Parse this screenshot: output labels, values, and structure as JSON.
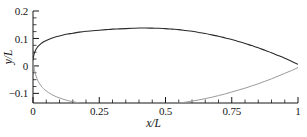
{
  "chart_data": {
    "type": "line",
    "title": "",
    "xlabel": "x/L",
    "ylabel": "y/L",
    "xlim": [
      0,
      1
    ],
    "ylim": [
      -0.135,
      0.2
    ],
    "grid": false,
    "legend_position": "none",
    "xticks": [
      0,
      0.25,
      0.5,
      0.75,
      1
    ],
    "xtick_labels": [
      "0",
      "0.25",
      "0.5",
      "0.75",
      "1"
    ],
    "x_minor_tick_step": 0.05,
    "yticks": [
      -0.1,
      0,
      0.1,
      0.2
    ],
    "ytick_labels": [
      "−0.1",
      "0",
      "0.1",
      "0.2"
    ],
    "y_minor_tick_step": 0.025,
    "annotations": [],
    "series": [
      {
        "name": "upper-surface",
        "color": "#2a2a2a",
        "x": [
          0.0,
          0.002,
          0.005,
          0.01,
          0.015,
          0.02,
          0.03,
          0.04,
          0.05,
          0.07,
          0.09,
          0.11,
          0.13,
          0.15,
          0.175,
          0.2,
          0.225,
          0.25,
          0.275,
          0.3,
          0.325,
          0.35,
          0.375,
          0.4,
          0.425,
          0.45,
          0.475,
          0.5,
          0.525,
          0.55,
          0.575,
          0.6,
          0.625,
          0.65,
          0.675,
          0.7,
          0.725,
          0.75,
          0.775,
          0.8,
          0.825,
          0.85,
          0.875,
          0.9,
          0.925,
          0.95,
          0.975,
          1.0
        ],
        "y": [
          0.022,
          0.034,
          0.046,
          0.058,
          0.066,
          0.072,
          0.081,
          0.088,
          0.093,
          0.101,
          0.107,
          0.112,
          0.116,
          0.119,
          0.123,
          0.126,
          0.128,
          0.13,
          0.132,
          0.134,
          0.135,
          0.136,
          0.137,
          0.138,
          0.138,
          0.1375,
          0.137,
          0.136,
          0.134,
          0.132,
          0.129,
          0.126,
          0.122,
          0.118,
          0.113,
          0.108,
          0.102,
          0.096,
          0.089,
          0.082,
          0.074,
          0.066,
          0.057,
          0.048,
          0.038,
          0.028,
          0.017,
          0.006
        ]
      },
      {
        "name": "lower-surface",
        "color": "#9a9a9a",
        "x": [
          0.0,
          0.002,
          0.005,
          0.01,
          0.015,
          0.02,
          0.03,
          0.04,
          0.05,
          0.07,
          0.09,
          0.11,
          0.13,
          0.15,
          0.175,
          0.2,
          0.225,
          0.25,
          0.275,
          0.3,
          0.325,
          0.35,
          0.375,
          0.4,
          0.425,
          0.45,
          0.475,
          0.5,
          0.525,
          0.55,
          0.575,
          0.6,
          0.625,
          0.65,
          0.675,
          0.7,
          0.725,
          0.75,
          0.775,
          0.8,
          0.825,
          0.85,
          0.875,
          0.9,
          0.925,
          0.95,
          0.975,
          1.0
        ],
        "y": [
          0.022,
          0.006,
          -0.012,
          -0.032,
          -0.046,
          -0.057,
          -0.072,
          -0.083,
          -0.091,
          -0.104,
          -0.113,
          -0.12,
          -0.126,
          -0.13,
          -0.135,
          -0.138,
          -0.14,
          -0.142,
          -0.143,
          -0.144,
          -0.1445,
          -0.145,
          -0.145,
          -0.1445,
          -0.144,
          -0.143,
          -0.1415,
          -0.14,
          -0.138,
          -0.135,
          -0.132,
          -0.128,
          -0.124,
          -0.119,
          -0.114,
          -0.108,
          -0.102,
          -0.095,
          -0.088,
          -0.081,
          -0.073,
          -0.065,
          -0.056,
          -0.047,
          -0.037,
          -0.027,
          -0.017,
          -0.006
        ]
      }
    ]
  },
  "axes": {
    "x_title": "x/L",
    "y_title": "y/L"
  }
}
